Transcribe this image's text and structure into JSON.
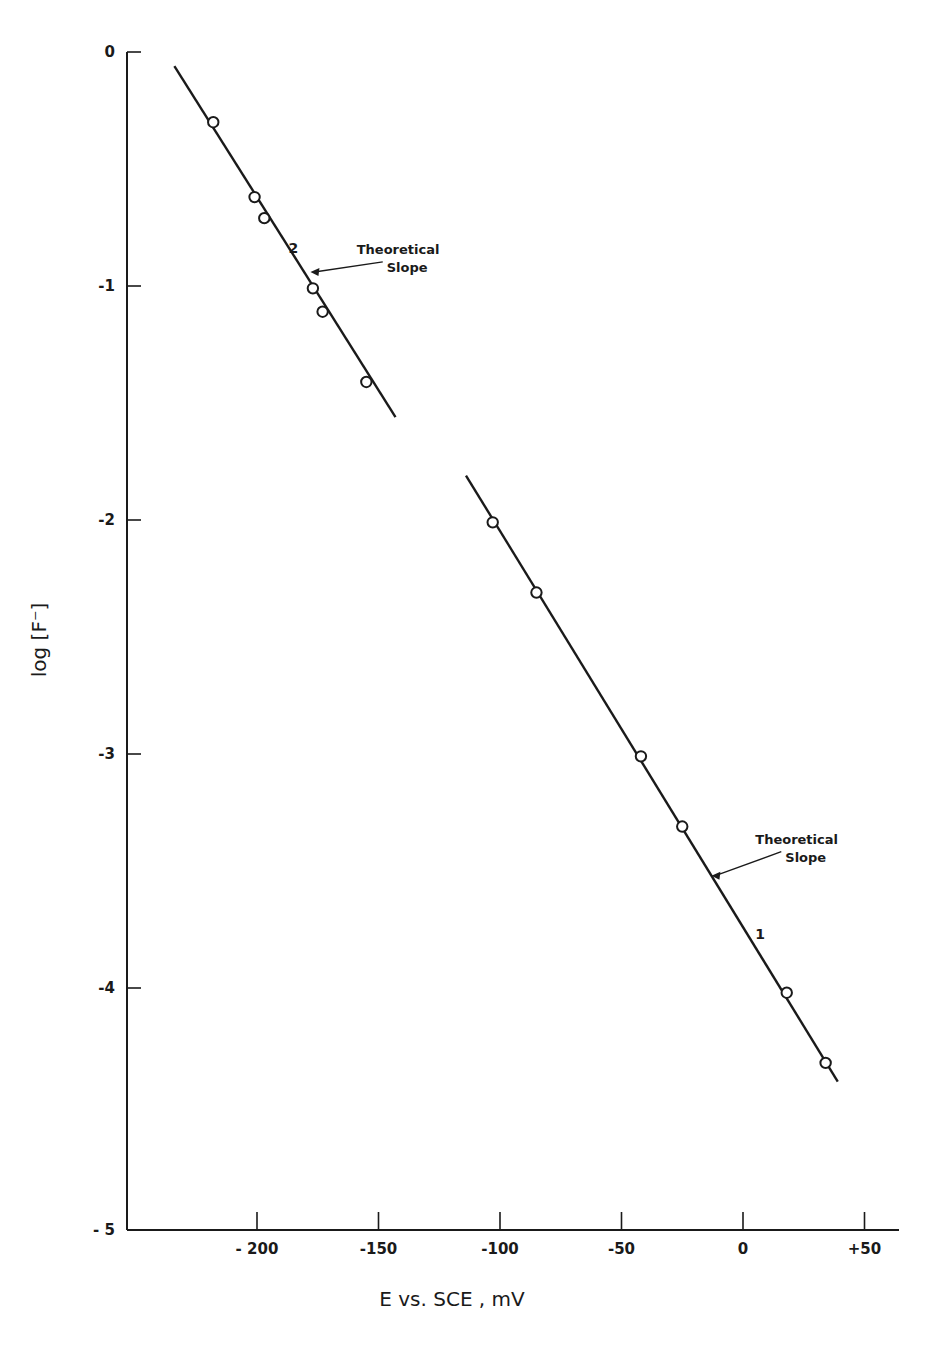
{
  "chart_data": {
    "type": "scatter",
    "title": "",
    "xlabel": "E vs. SCE , mV",
    "ylabel": "log [F⁻]",
    "xlim": [
      -245,
      65
    ],
    "ylim": [
      -5,
      0
    ],
    "grid": false,
    "legend": null,
    "x_ticks": [
      {
        "value": -200,
        "label": "- 200"
      },
      {
        "value": -150,
        "label": "-150"
      },
      {
        "value": -100,
        "label": "-100"
      },
      {
        "value": -50,
        "label": "-50"
      },
      {
        "value": 0,
        "label": "0"
      },
      {
        "value": 50,
        "label": "+50"
      }
    ],
    "y_ticks": [
      {
        "value": 0,
        "label": "0"
      },
      {
        "value": -1,
        "label": "-1"
      },
      {
        "value": -2,
        "label": "-2"
      },
      {
        "value": -3,
        "label": "-3"
      },
      {
        "value": -4,
        "label": "-4"
      },
      {
        "value": -5,
        "label": "- 5"
      }
    ],
    "series": [
      {
        "name": "2",
        "marker": "open-circle",
        "points": [
          {
            "x": -218,
            "y": -0.3
          },
          {
            "x": -201,
            "y": -0.62
          },
          {
            "x": -197,
            "y": -0.71
          },
          {
            "x": -177,
            "y": -1.01
          },
          {
            "x": -173,
            "y": -1.11
          },
          {
            "x": -155,
            "y": -1.41
          }
        ],
        "fit_line": {
          "x0": -234,
          "y0": -0.06,
          "x1": -143,
          "y1": -1.56
        },
        "label_pos": {
          "x": -185,
          "y": -0.86
        },
        "annotation": {
          "text_lines": [
            "Theoretical",
            "Slope"
          ],
          "text_x": -168,
          "text_y": -0.88,
          "arrow_to_x": -178,
          "arrow_to_y": -0.94
        }
      },
      {
        "name": "1",
        "marker": "open-circle",
        "points": [
          {
            "x": -103,
            "y": -2.01
          },
          {
            "x": -85,
            "y": -2.31
          },
          {
            "x": -42,
            "y": -3.01
          },
          {
            "x": -25,
            "y": -3.31
          },
          {
            "x": 18,
            "y": -4.02
          },
          {
            "x": 34,
            "y": -4.32
          }
        ],
        "fit_line": {
          "x0": -114,
          "y0": -1.81,
          "x1": 39,
          "y1": -4.4
        },
        "label_pos": {
          "x": 7,
          "y": -3.79
        },
        "annotation": {
          "text_lines": [
            "Theoretical",
            "Slope"
          ],
          "text_x": -4,
          "text_y": -3.4,
          "arrow_to_x": -13,
          "arrow_to_y": -3.52
        }
      }
    ]
  },
  "layout_px": {
    "x_origin_px": 743,
    "x_px_per_unit": 2.43,
    "y_zero_px": 52,
    "y_px_per_unit": 234,
    "axis_left_px": 127,
    "axis_bottom_px": 1230,
    "axis_right_px": 899
  }
}
